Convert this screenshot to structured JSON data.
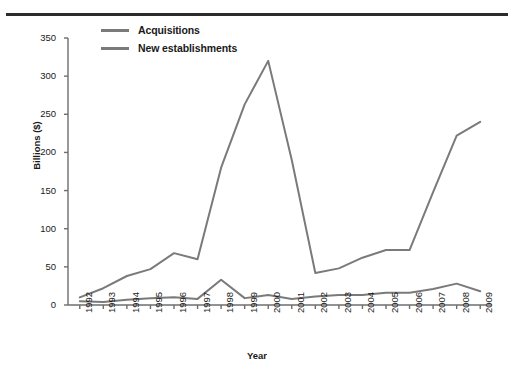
{
  "chart_data": {
    "type": "line",
    "title": "",
    "xlabel": "Year",
    "ylabel": "Billions ($)",
    "ylim": [
      0,
      350
    ],
    "yticks": [
      0,
      50,
      100,
      150,
      200,
      250,
      300,
      350
    ],
    "grid": false,
    "legend_position": "top-left",
    "categories": [
      "1992",
      "1993",
      "1994",
      "1995",
      "1996",
      "1997",
      "1998",
      "1999",
      "2000",
      "2001",
      "2002",
      "2003",
      "2004",
      "2005",
      "2006",
      "2007",
      "2008",
      "2009"
    ],
    "series": [
      {
        "name": "Acquisitions",
        "color": "#7a7a7a",
        "values": [
          5,
          4,
          7,
          9,
          10,
          8,
          33,
          9,
          13,
          8,
          11,
          13,
          13,
          16,
          16,
          21,
          28,
          18
        ]
      },
      {
        "name": "New establishments",
        "color": "#7a7a7a",
        "values": [
          10,
          22,
          38,
          47,
          68,
          60,
          180,
          263,
          320,
          190,
          42,
          48,
          62,
          72,
          72,
          148,
          222,
          240
        ]
      }
    ]
  },
  "axes": {
    "y_axis_title": "Billions ($)",
    "x_axis_title": "Year"
  },
  "legend": {
    "entries": [
      {
        "label": "Acquisitions"
      },
      {
        "label": "New establishments"
      }
    ]
  },
  "colors": {
    "line": "#7a7a7a",
    "axis": "#6e6e6e",
    "text": "#1a1a1a",
    "rule": "#2b2b2b"
  }
}
